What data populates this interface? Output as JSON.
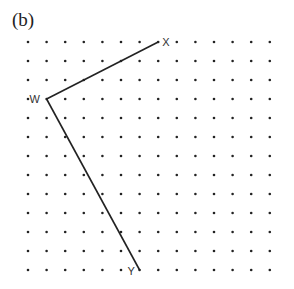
{
  "figure_label": "(b)",
  "grid": {
    "cols": 14,
    "rows": 13,
    "origin_x": 28,
    "origin_y": 42,
    "spacing_x": 18.6,
    "spacing_y": 19,
    "dot_color": "#222222"
  },
  "points": [
    {
      "name": "W",
      "col": 1,
      "row": 3,
      "label_dx": -17,
      "label_dy": 4
    },
    {
      "name": "X",
      "col": 7,
      "row": 0,
      "label_dx": 4,
      "label_dy": 4
    },
    {
      "name": "Y",
      "col": 6,
      "row": 12,
      "label_dx": -12,
      "label_dy": 5
    }
  ],
  "segments": [
    {
      "from": "W",
      "to": "X"
    },
    {
      "from": "W",
      "to": "Y"
    }
  ],
  "line_color": "#222222"
}
